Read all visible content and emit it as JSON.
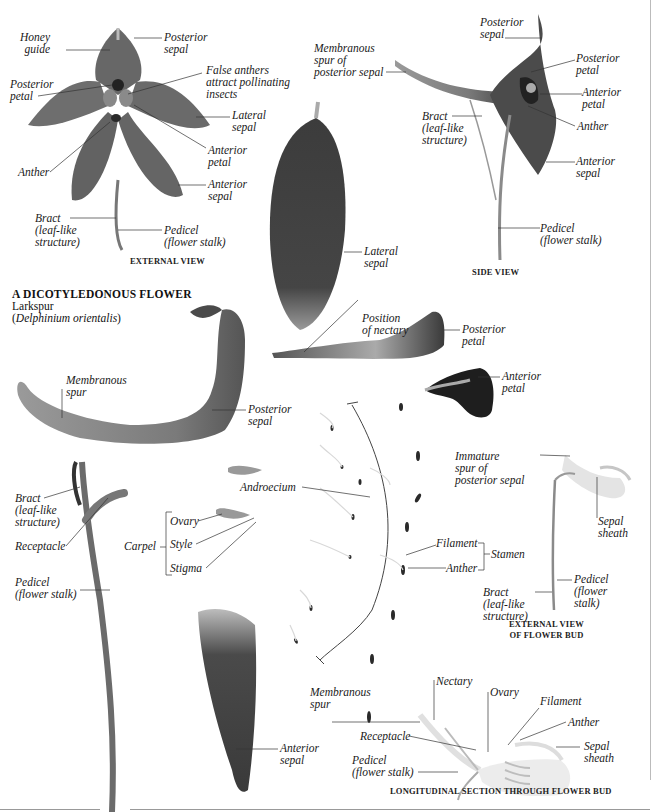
{
  "title": {
    "heading": "A DICOTYLEDONOUS FLOWER",
    "common_name": "Larkspur",
    "scientific_name_open": "(",
    "scientific_name": "Delphinium orientalis",
    "scientific_name_close": ")"
  },
  "captions": {
    "external_view": "EXTERNAL VIEW",
    "side_view": "SIDE VIEW",
    "external_view_bud": "EXTERNAL VIEW\nOF FLOWER BUD",
    "longitudinal_section": "LONGITUDINAL SECTION THROUGH FLOWER BUD"
  },
  "external_view_labels": {
    "honey_guide": "Honey\nguide",
    "posterior_sepal": "Posterior\nsepal",
    "posterior_petal": "Posterior\npetal",
    "false_anthers": "False anthers\nattract pollinating\ninsects",
    "lateral_sepal": "Lateral\nsepal",
    "anterior_petal": "Anterior\npetal",
    "anther": "Anther",
    "anterior_sepal": "Anterior\nsepal",
    "bract": "Bract\n(leaf-like\nstructure)",
    "pedicel": "Pedicel\n(flower stalk)"
  },
  "side_view_labels": {
    "posterior_sepal": "Posterior\nsepal",
    "membranous_spur": "Membranous\nspur of\nposterior sepal",
    "posterior_petal": "Posterior\npetal",
    "anterior_petal": "Anterior\npetal",
    "bract": "Bract\n(leaf-like\nstructure)",
    "anther": "Anther",
    "anterior_sepal": "Anterior\nsepal",
    "pedicel": "Pedicel\n(flower stalk)"
  },
  "dissected_labels": {
    "lateral_sepal": "Lateral\nsepal",
    "position_of_nectary": "Position\nof nectary",
    "posterior_petal": "Posterior\npetal",
    "anterior_petal": "Anterior\npetal",
    "membranous_spur": "Membranous\nspur",
    "posterior_sepal": "Posterior\nsepal",
    "androecium": "Androecium",
    "bract": "Bract\n(leaf-like\nstructure)",
    "receptacle": "Receptacle",
    "carpel": "Carpel",
    "ovary": "Ovary",
    "style": "Style",
    "stigma": "Stigma",
    "pedicel": "Pedicel\n(flower stalk)",
    "filament": "Filament",
    "anther": "Anther",
    "stamen": "Stamen",
    "anterior_sepal": "Anterior\nsepal"
  },
  "bud_labels": {
    "immature_spur": "Immature\nspur of\nposterior sepal",
    "sepal_sheath": "Sepal\nsheath",
    "pedicel": "Pedicel\n(flower\nstalk)",
    "bract": "Bract\n(leaf-like\nstructure)"
  },
  "section_labels": {
    "membranous_spur": "Membranous\nspur",
    "nectary": "Nectary",
    "ovary": "Ovary",
    "filament": "Filament",
    "anther": "Anther",
    "receptacle": "Receptacle",
    "sepal_sheath": "Sepal\nsheath",
    "pedicel": "Pedicel\n(flower stalk)"
  },
  "colors": {
    "petal_dark": "#4a4a4a",
    "petal_mid": "#6a6a6a",
    "leader_line": "#333333",
    "text": "#1a1a1a"
  }
}
